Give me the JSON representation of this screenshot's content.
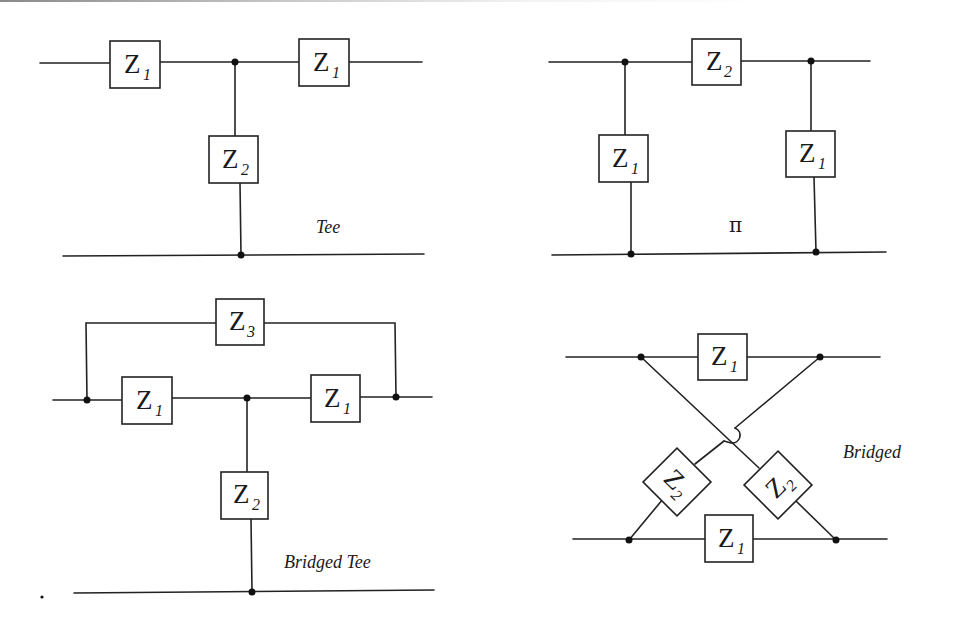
{
  "diagrams": {
    "tee": {
      "label": "Tee",
      "series_left": {
        "main": "Z",
        "sub": "1"
      },
      "series_right": {
        "main": "Z",
        "sub": "1"
      },
      "shunt": {
        "main": "Z",
        "sub": "2"
      }
    },
    "pi": {
      "label": "π",
      "series": {
        "main": "Z",
        "sub": "2"
      },
      "shunt_left": {
        "main": "Z",
        "sub": "1"
      },
      "shunt_right": {
        "main": "Z",
        "sub": "1"
      }
    },
    "bridged_tee": {
      "label": "Bridged Tee",
      "bridge": {
        "main": "Z",
        "sub": "3"
      },
      "series_left": {
        "main": "Z",
        "sub": "1"
      },
      "series_right": {
        "main": "Z",
        "sub": "1"
      },
      "shunt": {
        "main": "Z",
        "sub": "2"
      }
    },
    "bridged": {
      "label": "Bridged",
      "series_top": {
        "main": "Z",
        "sub": "1"
      },
      "series_bottom": {
        "main": "Z",
        "sub": "1"
      },
      "cross_left": {
        "main": "Z",
        "sub": "2"
      },
      "cross_right": {
        "main": "Z",
        "sub": "2"
      }
    }
  }
}
